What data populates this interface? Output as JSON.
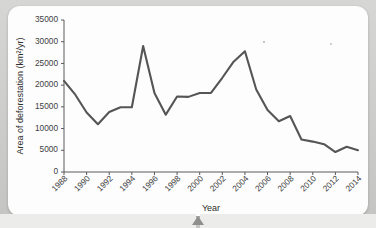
{
  "chart_data": {
    "type": "line",
    "title": "",
    "xlabel": "Year",
    "ylabel": "Area of deforestation (km²/yr)",
    "ylim": [
      0,
      35000
    ],
    "xlim": [
      1988,
      2014
    ],
    "grid": false,
    "legend": "none",
    "line_color": "#555555",
    "y_ticks": [
      0,
      5000,
      10000,
      15000,
      20000,
      25000,
      30000,
      35000
    ],
    "y_tick_labels": [
      "0",
      "5000",
      "10000",
      "15000",
      "20000",
      "25000",
      "30000",
      "35000"
    ],
    "x_ticks": [
      1988,
      1990,
      1992,
      1994,
      1996,
      1998,
      2000,
      2002,
      2004,
      2006,
      2008,
      2010,
      2012,
      2014
    ],
    "x_tick_labels": [
      "1988",
      "1990",
      "1992",
      "1994",
      "1996",
      "1998",
      "2000",
      "2002",
      "2004",
      "2006",
      "2008",
      "2010",
      "2012",
      "2014"
    ],
    "x": [
      1988,
      1989,
      1990,
      1991,
      1992,
      1993,
      1994,
      1995,
      1996,
      1997,
      1998,
      1999,
      2000,
      2001,
      2002,
      2003,
      2004,
      2005,
      2006,
      2007,
      2008,
      2009,
      2010,
      2011,
      2012,
      2013,
      2014
    ],
    "series": [
      {
        "name": "Area of deforestation",
        "values": [
          21000,
          17800,
          13700,
          11000,
          13800,
          14900,
          14900,
          29000,
          18200,
          13200,
          17400,
          17300,
          18200,
          18200,
          21700,
          25400,
          27800,
          19000,
          14300,
          11700,
          12900,
          7500,
          7000,
          6400,
          4600,
          5800,
          5000
        ]
      }
    ]
  },
  "canvas": {
    "background_color": "#c9c9c7",
    "card_color": "#fdfdfd"
  }
}
